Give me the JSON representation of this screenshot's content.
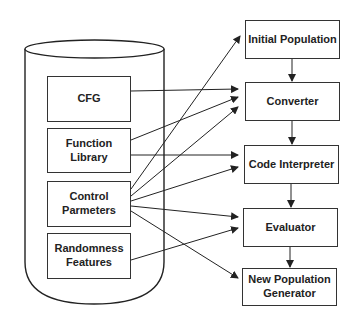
{
  "diagram": {
    "store": {
      "items": [
        {
          "label": "CFG"
        },
        {
          "label": "Function\nLibrary"
        },
        {
          "label": "Control\nParmeters"
        },
        {
          "label": "Randomness\nFeatures"
        }
      ]
    },
    "pipeline": [
      {
        "label": "Initial Population"
      },
      {
        "label": "Converter"
      },
      {
        "label": "Code Interpreter"
      },
      {
        "label": "Evaluator"
      },
      {
        "label": "New Population\nGenerator"
      }
    ],
    "edges": [
      {
        "from": "CFG",
        "to": "Converter"
      },
      {
        "from": "Function Library",
        "to": "Converter"
      },
      {
        "from": "Function Library",
        "to": "Code Interpreter"
      },
      {
        "from": "Control Parmeters",
        "to": "Initial Population"
      },
      {
        "from": "Control Parmeters",
        "to": "Converter"
      },
      {
        "from": "Control Parmeters",
        "to": "Code Interpreter"
      },
      {
        "from": "Control Parmeters",
        "to": "Evaluator"
      },
      {
        "from": "Control Parmeters",
        "to": "New Population Generator"
      },
      {
        "from": "Randomness Features",
        "to": "Evaluator"
      },
      {
        "from": "Initial Population",
        "to": "Converter"
      },
      {
        "from": "Converter",
        "to": "Code Interpreter"
      },
      {
        "from": "Code Interpreter",
        "to": "Evaluator"
      },
      {
        "from": "Evaluator",
        "to": "New Population Generator"
      }
    ]
  }
}
